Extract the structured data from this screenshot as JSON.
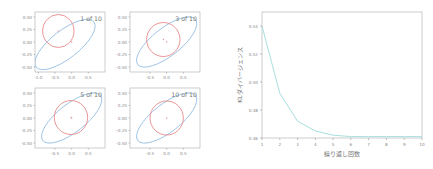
{
  "chart_data": [
    {
      "type": "scatter",
      "title": "Ellipse approximation panels (2x2 grid)",
      "panels": [
        {
          "label": "1 of 10",
          "xticks": [
            "-1.0",
            "-0.5",
            "0.0",
            "0.5"
          ],
          "yticks": [
            "0.50",
            "0.25",
            "0.00",
            "-0.25",
            "-0.50"
          ],
          "target_ellipse": {
            "color": "#9cc3e6",
            "cx": -0.2,
            "cy": -0.05,
            "rx": 1.1,
            "ry": 0.28,
            "angle_deg": -38
          },
          "approx_ellipse": {
            "color": "#e88a8a",
            "cx": -0.4,
            "cy": 0.22,
            "rx": 0.47,
            "ry": 0.33,
            "angle_deg": 0
          },
          "centers": [
            [
              -0.4,
              0.22
            ],
            [
              0.0,
              0.0
            ]
          ]
        },
        {
          "label": "3 of 10",
          "xticks": [
            "-0.5",
            "0.0",
            "0.5"
          ],
          "yticks": [
            "0.50",
            "0.25",
            "0.00",
            "-0.25",
            "-0.50"
          ],
          "target_ellipse": {
            "color": "#9cc3e6",
            "cx": 0.0,
            "cy": 0.0,
            "rx": 1.1,
            "ry": 0.28,
            "angle_deg": -38
          },
          "approx_ellipse": {
            "color": "#e88a8a",
            "cx": -0.1,
            "cy": 0.05,
            "rx": 0.5,
            "ry": 0.34,
            "angle_deg": 0
          },
          "centers": [
            [
              -0.1,
              0.05
            ],
            [
              0.0,
              0.0
            ]
          ]
        },
        {
          "label": "5 of 10",
          "xticks": [
            "-0.5",
            "0.0",
            "0.5"
          ],
          "yticks": [
            "0.50",
            "0.25",
            "0.00",
            "-0.25",
            "-0.50"
          ],
          "target_ellipse": {
            "color": "#9cc3e6",
            "cx": 0.0,
            "cy": 0.0,
            "rx": 1.1,
            "ry": 0.28,
            "angle_deg": -38
          },
          "approx_ellipse": {
            "color": "#e88a8a",
            "cx": -0.02,
            "cy": 0.01,
            "rx": 0.5,
            "ry": 0.34,
            "angle_deg": 0
          },
          "centers": [
            [
              -0.02,
              0.01
            ],
            [
              0.0,
              0.0
            ]
          ]
        },
        {
          "label": "10 of 10",
          "xticks": [
            "-0.5",
            "0.0",
            "0.5"
          ],
          "yticks": [
            "0.50",
            "0.25",
            "0.00",
            "-0.25",
            "-0.50"
          ],
          "target_ellipse": {
            "color": "#9cc3e6",
            "cx": 0.0,
            "cy": 0.0,
            "rx": 1.1,
            "ry": 0.28,
            "angle_deg": -38
          },
          "approx_ellipse": {
            "color": "#e88a8a",
            "cx": 0.0,
            "cy": 0.0,
            "rx": 0.5,
            "ry": 0.34,
            "angle_deg": 0
          },
          "centers": [
            [
              0.0,
              0.0
            ]
          ]
        }
      ]
    },
    {
      "type": "line",
      "title": "",
      "xlabel": "繰り返し回数",
      "ylabel": "KLダイバージェンス",
      "x": [
        1,
        2,
        3,
        4,
        5,
        6,
        7,
        8,
        9,
        10
      ],
      "series": [
        {
          "name": "KL",
          "color": "#a8dfe0",
          "values": [
            0.54,
            0.492,
            0.472,
            0.465,
            0.462,
            0.461,
            0.461,
            0.461,
            0.461,
            0.461
          ]
        }
      ],
      "xticks": [
        "1",
        "2",
        "3",
        "4",
        "5",
        "6",
        "7",
        "8",
        "9",
        "10"
      ],
      "yticks": [
        "0.54",
        "0.52",
        "0.50",
        "0.48",
        "0.46"
      ],
      "xlim": [
        1,
        10
      ],
      "ylim": [
        0.46,
        0.55
      ],
      "grid": false,
      "legend": "none"
    }
  ]
}
